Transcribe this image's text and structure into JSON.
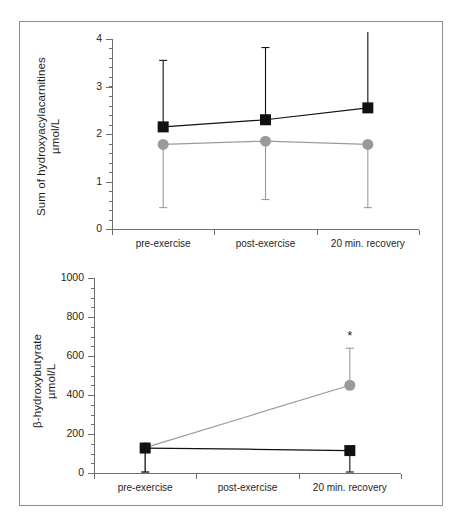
{
  "figure": {
    "background": "#ffffff",
    "frame_color": "#8c8c8c",
    "axis_color": "#6e6e6e",
    "series_colors": {
      "black_square": "#111111",
      "gray_circle": "#9a9a9a"
    }
  },
  "charts": [
    {
      "id": "hydroxyacylcarnitines",
      "ylabel_line1": "Sum of hydroxyacylacarnitines",
      "ylabel_line2": "µmol/L",
      "yticks": [
        "0",
        "1",
        "2",
        "3",
        "4"
      ],
      "xcategories": [
        "pre-exercise",
        "post-exercise",
        "20 min. recovery"
      ]
    },
    {
      "id": "hydroxybutyrate",
      "ylabel_line1": "β-hydroxybutyrate",
      "ylabel_line2": "µmol/L",
      "yticks": [
        "0",
        "200",
        "400",
        "600",
        "800",
        "1000"
      ],
      "xcategories": [
        "pre-exercise",
        "post-exercise",
        "20 min. recovery"
      ],
      "annotation": "*"
    }
  ],
  "chart_data": [
    {
      "type": "line",
      "title": "",
      "xlabel": "",
      "ylabel": "Sum of hydroxyacylacarnitines µmol/L",
      "categories": [
        "pre-exercise",
        "post-exercise",
        "20 min. recovery"
      ],
      "ylim": [
        0,
        4
      ],
      "ytick_values": [
        0,
        1,
        2,
        3,
        4
      ],
      "yminor_step": 0.2,
      "grid": false,
      "legend": "none",
      "series": [
        {
          "name": "black-square-series",
          "marker": "square",
          "color": "#111111",
          "values": [
            2.15,
            2.3,
            2.55
          ],
          "err_upper": [
            3.55,
            3.82,
            4.15
          ],
          "err_lower": [
            2.15,
            2.3,
            2.55
          ]
        },
        {
          "name": "gray-circle-series",
          "marker": "circle",
          "color": "#9a9a9a",
          "values": [
            1.78,
            1.85,
            1.78
          ],
          "err_upper": [
            1.78,
            1.85,
            1.78
          ],
          "err_lower": [
            0.45,
            0.62,
            0.45
          ]
        }
      ]
    },
    {
      "type": "line",
      "title": "",
      "xlabel": "",
      "ylabel": "β-hydroxybutyrate µmol/L",
      "categories": [
        "pre-exercise",
        "post-exercise",
        "20 min. recovery"
      ],
      "ylim": [
        0,
        1000
      ],
      "ytick_values": [
        0,
        200,
        400,
        600,
        800,
        1000
      ],
      "yminor_step": 50,
      "grid": false,
      "legend": "none",
      "annotations": [
        {
          "text": "*",
          "category": "20 min. recovery",
          "value": 700,
          "series": "gray-circle-series"
        }
      ],
      "series": [
        {
          "name": "gray-circle-series",
          "marker": "circle",
          "color": "#9a9a9a",
          "values": [
            130,
            290,
            450
          ],
          "err_upper": [
            130,
            290,
            640
          ],
          "err_lower": [
            5,
            290,
            450
          ],
          "markers_shown": [
            true,
            false,
            true
          ]
        },
        {
          "name": "black-square-series",
          "marker": "square",
          "color": "#111111",
          "values": [
            128,
            122,
            115
          ],
          "err_upper": [
            128,
            122,
            115
          ],
          "err_lower": [
            5,
            122,
            5
          ],
          "markers_shown": [
            true,
            false,
            true
          ]
        }
      ]
    }
  ]
}
